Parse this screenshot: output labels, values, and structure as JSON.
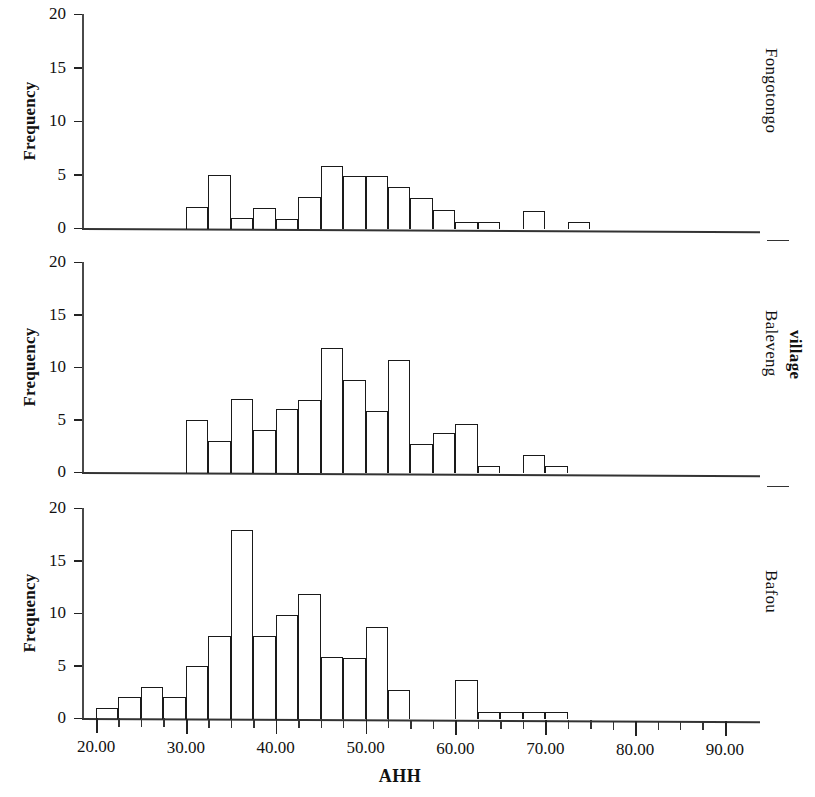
{
  "chart_data": {
    "type": "bar",
    "title": "",
    "xlabel": "AHH",
    "ylabel": "Frequency",
    "group_label": "village",
    "xlim": [
      18.75,
      91.25
    ],
    "ylim": [
      0,
      20
    ],
    "yticks": [
      0,
      5,
      10,
      15,
      20
    ],
    "ytick_labels": [
      "0",
      "5",
      "10",
      "15",
      "20"
    ],
    "xticks": [
      20,
      30,
      40,
      50,
      60,
      70,
      80,
      90
    ],
    "xtick_labels": [
      "20.00",
      "30.00",
      "40.00",
      "50.00",
      "60.00",
      "70.00",
      "80.00",
      "90.00"
    ],
    "bin_width": 2.5,
    "grid": false,
    "legend": "none",
    "panels": [
      {
        "name": "Fongotongo",
        "bins": [
          {
            "x0": 30.0,
            "x1": 32.5,
            "value": 2.0
          },
          {
            "x0": 32.5,
            "x1": 35.0,
            "value": 5.0
          },
          {
            "x0": 35.0,
            "x1": 37.5,
            "value": 0.9
          },
          {
            "x0": 37.5,
            "x1": 40.0,
            "value": 1.9
          },
          {
            "x0": 40.0,
            "x1": 42.5,
            "value": 0.8
          },
          {
            "x0": 42.5,
            "x1": 45.0,
            "value": 2.9
          },
          {
            "x0": 45.0,
            "x1": 47.5,
            "value": 5.8
          },
          {
            "x0": 47.5,
            "x1": 50.0,
            "value": 4.9
          },
          {
            "x0": 50.0,
            "x1": 52.5,
            "value": 4.9
          },
          {
            "x0": 52.5,
            "x1": 55.0,
            "value": 3.8
          },
          {
            "x0": 55.0,
            "x1": 57.5,
            "value": 2.8
          },
          {
            "x0": 57.5,
            "x1": 60.0,
            "value": 1.7
          },
          {
            "x0": 60.0,
            "x1": 62.5,
            "value": 0.6
          },
          {
            "x0": 62.5,
            "x1": 65.0,
            "value": 0.6
          },
          {
            "x0": 67.5,
            "x1": 70.0,
            "value": 1.6
          },
          {
            "x0": 72.5,
            "x1": 75.0,
            "value": 0.6
          }
        ]
      },
      {
        "name": "Baleveng",
        "bins": [
          {
            "x0": 30.0,
            "x1": 32.5,
            "value": 5.0
          },
          {
            "x0": 32.5,
            "x1": 35.0,
            "value": 3.0
          },
          {
            "x0": 35.0,
            "x1": 37.5,
            "value": 7.0
          },
          {
            "x0": 37.5,
            "x1": 40.0,
            "value": 4.0
          },
          {
            "x0": 40.0,
            "x1": 42.5,
            "value": 6.0
          },
          {
            "x0": 42.5,
            "x1": 45.0,
            "value": 6.9
          },
          {
            "x0": 45.0,
            "x1": 47.5,
            "value": 11.8
          },
          {
            "x0": 47.5,
            "x1": 50.0,
            "value": 8.8
          },
          {
            "x0": 50.0,
            "x1": 52.5,
            "value": 5.8
          },
          {
            "x0": 52.5,
            "x1": 55.0,
            "value": 10.7
          },
          {
            "x0": 55.0,
            "x1": 57.5,
            "value": 2.7
          },
          {
            "x0": 57.5,
            "x1": 60.0,
            "value": 3.7
          },
          {
            "x0": 60.0,
            "x1": 62.5,
            "value": 4.6
          },
          {
            "x0": 62.5,
            "x1": 65.0,
            "value": 0.6
          },
          {
            "x0": 67.5,
            "x1": 70.0,
            "value": 1.6
          },
          {
            "x0": 70.0,
            "x1": 72.5,
            "value": 0.6
          }
        ]
      },
      {
        "name": "Bafou",
        "bins": [
          {
            "x0": 20.0,
            "x1": 22.5,
            "value": 1.0
          },
          {
            "x0": 22.5,
            "x1": 25.0,
            "value": 2.0
          },
          {
            "x0": 25.0,
            "x1": 27.5,
            "value": 3.0
          },
          {
            "x0": 27.5,
            "x1": 30.0,
            "value": 2.0
          },
          {
            "x0": 30.0,
            "x1": 32.5,
            "value": 5.0
          },
          {
            "x0": 32.5,
            "x1": 35.0,
            "value": 7.8
          },
          {
            "x0": 35.0,
            "x1": 37.5,
            "value": 17.9
          },
          {
            "x0": 37.5,
            "x1": 40.0,
            "value": 7.8
          },
          {
            "x0": 40.0,
            "x1": 42.5,
            "value": 9.8
          },
          {
            "x0": 42.5,
            "x1": 45.0,
            "value": 11.8
          },
          {
            "x0": 45.0,
            "x1": 47.5,
            "value": 5.8
          },
          {
            "x0": 47.5,
            "x1": 50.0,
            "value": 5.7
          },
          {
            "x0": 50.0,
            "x1": 52.5,
            "value": 8.7
          },
          {
            "x0": 52.5,
            "x1": 55.0,
            "value": 2.7
          },
          {
            "x0": 60.0,
            "x1": 62.5,
            "value": 3.6
          },
          {
            "x0": 62.5,
            "x1": 65.0,
            "value": 0.6
          },
          {
            "x0": 65.0,
            "x1": 67.5,
            "value": 0.6
          },
          {
            "x0": 67.5,
            "x1": 70.0,
            "value": 0.6
          },
          {
            "x0": 70.0,
            "x1": 72.5,
            "value": 0.6
          }
        ]
      }
    ]
  }
}
